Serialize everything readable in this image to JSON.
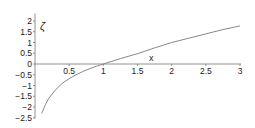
{
  "chart_data": {
    "type": "line",
    "title": "",
    "xlabel": "x",
    "ylabel": "ζ",
    "xlim": [
      0,
      3
    ],
    "ylim": [
      -2.5,
      2.2
    ],
    "grid": false,
    "legend": null,
    "x_ticks": [
      "0.5",
      "1",
      "1.5",
      "2",
      "2.5",
      "3"
    ],
    "y_ticks": [
      "2",
      "1.5",
      "1",
      "0.5",
      "0",
      "-0.5",
      "-1",
      "-1.5",
      "-2",
      "-2.5"
    ],
    "series": [
      {
        "name": "ζ(x)",
        "color": "#888888",
        "x": [
          0.1,
          0.15,
          0.2,
          0.3,
          0.4,
          0.5,
          0.6,
          0.7,
          0.8,
          0.9,
          1.0,
          1.25,
          1.5,
          1.75,
          2.0,
          2.25,
          2.5,
          2.75,
          3.0
        ],
        "y": [
          -2.3,
          -1.9,
          -1.6,
          -1.2,
          -0.9,
          -0.68,
          -0.5,
          -0.35,
          -0.22,
          -0.1,
          0.0,
          0.25,
          0.48,
          0.75,
          1.0,
          1.2,
          1.4,
          1.6,
          1.77
        ]
      }
    ]
  }
}
